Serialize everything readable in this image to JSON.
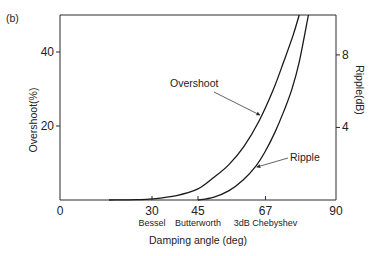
{
  "chart_data": {
    "type": "line",
    "panel_label": "(b)",
    "title": "",
    "xlabel": "Damping angle (deg)",
    "ylabel": "Overshoot(%)",
    "y2label": "Ripple(dB)",
    "xlim": [
      0,
      90
    ],
    "ylim": [
      0,
      50
    ],
    "y2lim": [
      0,
      10.2
    ],
    "grid": false,
    "x_ticks": [
      {
        "value": 0,
        "label": "0",
        "sublabel": ""
      },
      {
        "value": 30,
        "label": "30",
        "sublabel": "Bessel"
      },
      {
        "value": 45,
        "label": "45",
        "sublabel": "Butterworth"
      },
      {
        "value": 67,
        "label": "67",
        "sublabel": "3dB Chebyshev"
      },
      {
        "value": 90,
        "label": "90",
        "sublabel": ""
      }
    ],
    "y_ticks": [
      {
        "value": 20,
        "label": "20"
      },
      {
        "value": 40,
        "label": "40"
      }
    ],
    "y2_ticks": [
      {
        "value": 4,
        "label": "4"
      },
      {
        "value": 8,
        "label": "8"
      }
    ],
    "series": [
      {
        "name": "Overshoot",
        "axis": "left",
        "x": [
          16,
          25,
          30,
          38,
          45,
          50,
          55,
          60,
          65,
          69.5,
          73,
          76,
          78
        ],
        "y": [
          0,
          0.1,
          0.3,
          1.2,
          3.0,
          6.0,
          9.5,
          14.5,
          21.5,
          29.7,
          37.5,
          44.5,
          50
        ]
      },
      {
        "name": "Ripple",
        "axis": "right",
        "x": [
          45,
          50,
          55,
          59.7,
          64,
          67,
          70,
          73,
          75.6,
          78,
          81
        ],
        "y": [
          0,
          0.15,
          0.5,
          1.1,
          1.9,
          2.7,
          3.7,
          4.9,
          6.1,
          7.6,
          10.2
        ]
      }
    ],
    "annotations": [
      {
        "text": "Overshoot",
        "target_series": "Overshoot"
      },
      {
        "text": "Ripple",
        "target_series": "Ripple"
      }
    ],
    "legend": "none"
  }
}
